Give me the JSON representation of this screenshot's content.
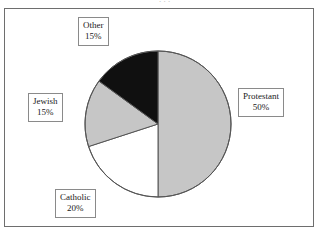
{
  "figure": {
    "top_partial_text": ". . .",
    "frame_color": "#6e6e6e",
    "background": "#ffffff"
  },
  "labels": {
    "protestant": {
      "name": "Protestant",
      "pct": "50%"
    },
    "catholic": {
      "name": "Catholic",
      "pct": "20%"
    },
    "jewish": {
      "name": "Jewish",
      "pct": "15%"
    },
    "other": {
      "name": "Other",
      "pct": "15%"
    }
  },
  "chart_data": {
    "type": "pie",
    "title": "",
    "subtitle": "",
    "xlabel": "",
    "ylabel": "",
    "legend": "none",
    "grid": false,
    "start_angle_deg": 0,
    "direction": "clockwise",
    "units": "percent",
    "total": 100,
    "categories": [
      "Protestant",
      "Catholic",
      "Jewish",
      "Other"
    ],
    "values": [
      50,
      20,
      15,
      15
    ],
    "labels": [
      "Protestant 50%",
      "Catholic 20%",
      "Jewish 15%",
      "Other 15%"
    ],
    "colors": [
      "#c6c6c6",
      "#ffffff",
      "#c6c6c6",
      "#101010"
    ],
    "slices": [
      {
        "name": "Protestant",
        "value": 50,
        "pct": "50%",
        "color": "#c6c6c6",
        "start_deg": 0,
        "end_deg": 180,
        "sweep_deg": 180
      },
      {
        "name": "Catholic",
        "value": 20,
        "pct": "20%",
        "color": "#ffffff",
        "start_deg": 180,
        "end_deg": 252,
        "sweep_deg": 72
      },
      {
        "name": "Jewish",
        "value": 15,
        "pct": "15%",
        "color": "#c6c6c6",
        "start_deg": 252,
        "end_deg": 306,
        "sweep_deg": 54
      },
      {
        "name": "Other",
        "value": 15,
        "pct": "15%",
        "color": "#101010",
        "start_deg": 306,
        "end_deg": 360,
        "sweep_deg": 54
      }
    ],
    "geometry": {
      "cx": 158,
      "cy": 124,
      "r": 73,
      "outline_color": "#555555"
    }
  }
}
